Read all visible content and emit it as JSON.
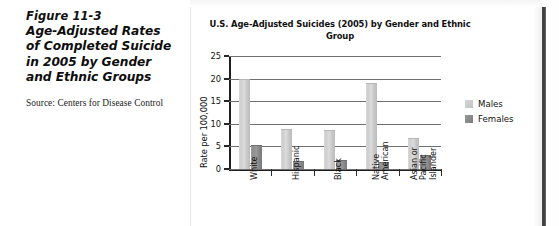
{
  "figure": {
    "number": "Figure 11-3",
    "title": "Age-Adjusted Rates of Completed Suicide in 2005 by Gender and Ethnic Groups",
    "source": "Source: Centers for Disease Control"
  },
  "legend": {
    "males_label": "Males",
    "females_label": "Females",
    "males_color": "#cdcdcd",
    "females_color": "#8a8a8a"
  },
  "axis": {
    "y_label": "Rate per 100,000",
    "y_ticks": [
      "0",
      "5",
      "10",
      "15",
      "20",
      "25"
    ]
  },
  "chart_data": {
    "type": "bar",
    "title": "U.S. Age-Adjusted Suicides (2005) by Gender and Ethnic Group",
    "xlabel": "",
    "ylabel": "Rate per 100,000",
    "ylim": [
      0,
      25
    ],
    "yticks": [
      0,
      5,
      10,
      15,
      20,
      25
    ],
    "grid": true,
    "legend_position": "right",
    "categories": [
      "White",
      "Hispanic",
      "Black",
      "Native American",
      "Asian or Pacific Islander"
    ],
    "category_lines": [
      [
        "White"
      ],
      [
        "Hispanic"
      ],
      [
        "Black"
      ],
      [
        "Native",
        "American"
      ],
      [
        "Asian or",
        "Pacific",
        "Islander"
      ]
    ],
    "series": [
      {
        "name": "Males",
        "color": "#cdcdcd",
        "values": [
          19.7,
          8.7,
          8.5,
          18.7,
          6.6
        ]
      },
      {
        "name": "Females",
        "color": "#8a8a8a",
        "values": [
          5.0,
          1.5,
          1.7,
          1.3,
          2.9
        ]
      }
    ]
  }
}
